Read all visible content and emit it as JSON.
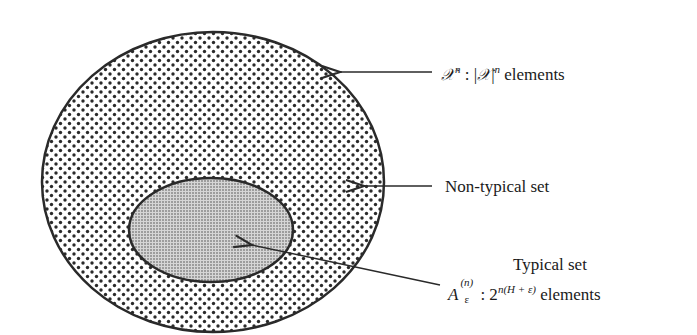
{
  "diagram": {
    "outer_set": {
      "symbol": "𝒳",
      "sup": "n",
      "sep": " : ",
      "abs_open": "|",
      "abs_close": "|",
      "suffix": " elements",
      "description": "All sequences"
    },
    "non_typical": {
      "label": "Non-typical set"
    },
    "typical": {
      "title": "Typical set",
      "symbol": "A",
      "sub": "ε",
      "sup": "(n)",
      "sep": ": 2",
      "exponent": "n(H +  ε)",
      "suffix": "elements"
    }
  },
  "colors": {
    "stroke": "#2a2a2a",
    "outer_dots": "#2a2a2a",
    "inner_fill": "#c8c8c8",
    "background": "#ffffff"
  }
}
